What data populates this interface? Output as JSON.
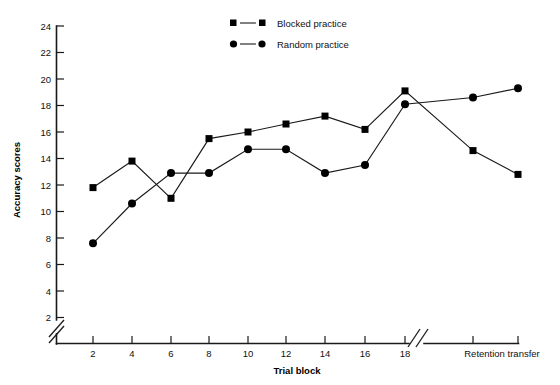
{
  "chart_data": {
    "type": "line",
    "title": "",
    "xlabel": "Trial block",
    "ylabel": "Accuracy scores",
    "ylim": [
      2,
      24
    ],
    "ytick_step": 2,
    "yticks": [
      2,
      4,
      6,
      8,
      10,
      12,
      14,
      16,
      18,
      20,
      22,
      24
    ],
    "yaxis_break": true,
    "xaxis_break": true,
    "grid": false,
    "legend_position": "top-center",
    "categories": [
      "2",
      "4",
      "6",
      "8",
      "10",
      "12",
      "14",
      "16",
      "18",
      "Retention",
      "Transfer"
    ],
    "xticks": [
      2,
      4,
      6,
      8,
      10,
      12,
      14,
      16,
      18
    ],
    "post_break_labels": [
      "Retention transfer"
    ],
    "series": [
      {
        "name": "Blocked practice",
        "marker": "square",
        "values": [
          11.8,
          13.8,
          11.0,
          15.5,
          16.0,
          16.6,
          17.2,
          16.2,
          19.1,
          14.6,
          12.8
        ]
      },
      {
        "name": "Random practice",
        "marker": "circle",
        "values": [
          7.6,
          10.6,
          12.9,
          12.9,
          14.7,
          14.7,
          12.9,
          13.5,
          18.1,
          18.6,
          19.3
        ]
      }
    ]
  },
  "legend": {
    "items": [
      {
        "label": "Blocked practice",
        "marker": "square"
      },
      {
        "label": "Random practice",
        "marker": "circle"
      }
    ]
  },
  "axes": {
    "y_title": "Accuracy scores",
    "x_title": "Trial block",
    "x_right_label": "Retention transfer",
    "y_tick_labels": [
      "24",
      "22",
      "20",
      "18",
      "16",
      "14",
      "12",
      "10",
      "8",
      "6",
      "4",
      "2"
    ],
    "x_tick_labels": [
      "2",
      "4",
      "6",
      "8",
      "10",
      "12",
      "14",
      "16",
      "18"
    ]
  },
  "colors": {
    "ink": "#1a1a1a",
    "marker": "#000000",
    "background": "#ffffff"
  }
}
